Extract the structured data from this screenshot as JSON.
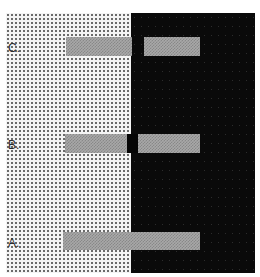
{
  "figure": {
    "background_left_color": "#f4f4f4",
    "background_right_color": "#0a0a0a",
    "bar_color": "#a8a8a8"
  },
  "labels": {
    "c": "C.",
    "b": "B.",
    "a": "A."
  },
  "rows": [
    {
      "id": "C",
      "label": "C.",
      "configuration": "separate bars, one on each background"
    },
    {
      "id": "B",
      "label": "B.",
      "configuration": "separate bars joined by a small black block at the boundary"
    },
    {
      "id": "A",
      "label": "A.",
      "configuration": "single continuous bar spanning both backgrounds"
    }
  ]
}
